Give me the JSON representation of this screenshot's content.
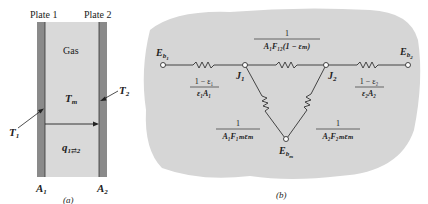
{
  "figure_a": {
    "plate1_label": "Plate 1",
    "plate2_label": "Plate 2",
    "gas_label": "Gas",
    "Tm_label": "T",
    "Tm_sub": "m",
    "T1_label": "T",
    "T1_sub": "1",
    "T2_label": "T",
    "T2_sub": "2",
    "q_label": "q",
    "q_sub": "1⇄2",
    "A1_label": "A",
    "A1_sub": "1",
    "A2_label": "A",
    "A2_sub": "2",
    "caption": "(a)",
    "colors": {
      "gas": "#d9d9d9",
      "plate": "#8a8a8a"
    }
  },
  "figure_b": {
    "Eb1": {
      "main": "E",
      "sub": "b",
      "subsub": "1"
    },
    "Eb2": {
      "main": "E",
      "sub": "b",
      "subsub": "2"
    },
    "Ebm": {
      "main": "E",
      "sub": "b",
      "subsub": "m"
    },
    "J1": {
      "main": "J",
      "sub": "1"
    },
    "J2": {
      "main": "J",
      "sub": "2"
    },
    "R1": {
      "num": "1 − ε₁",
      "den": "ε₁A₁"
    },
    "R2": {
      "num": "1 − ε₂",
      "den": "ε₂A₂"
    },
    "R12": {
      "num": "1",
      "den": "A₁F₁₂(1 − εₘ)"
    },
    "R1m": {
      "num": "1",
      "den": "A₁F₁ₘεₘ"
    },
    "R2m": {
      "num": "1",
      "den": "A₂F₂ₘεₘ"
    },
    "caption": "(b)",
    "colors": {
      "background": "#d6d6d6",
      "wire": "#333333"
    }
  }
}
